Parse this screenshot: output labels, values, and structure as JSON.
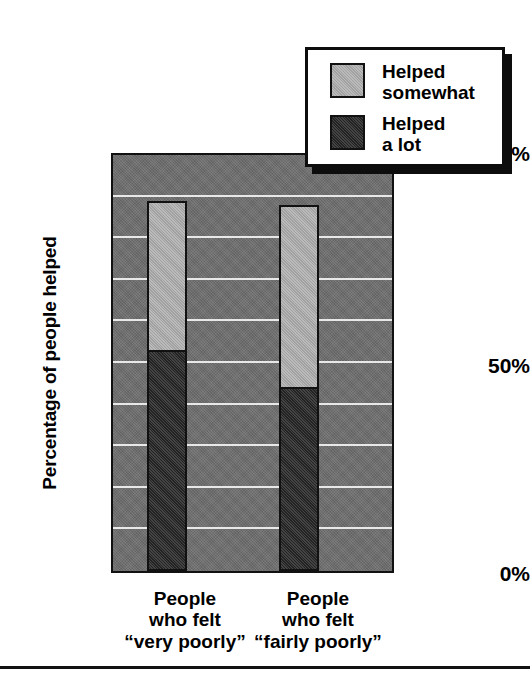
{
  "chart_data": {
    "type": "bar",
    "stacked": true,
    "title": "",
    "xlabel": "",
    "ylabel": "Percentage of people helped",
    "ylim": [
      0,
      100
    ],
    "ytick_labels": [
      "100%",
      "50%",
      "0%"
    ],
    "ytick_values": [
      100,
      50,
      0
    ],
    "gridlines": [
      10,
      20,
      30,
      40,
      50,
      60,
      70,
      80,
      90
    ],
    "grid": true,
    "legend_position": "top-right",
    "categories": [
      "People who felt “very poorly”",
      "People who felt “fairly poorly”"
    ],
    "category_lines": [
      [
        "People",
        "who felt",
        "“very poorly”"
      ],
      [
        "People",
        "who felt",
        "“fairly poorly”"
      ]
    ],
    "category_emphasis": [
      "very",
      "fairly"
    ],
    "series": [
      {
        "name": "Helped a lot",
        "values": [
          53,
          44
        ],
        "color": "#282828"
      },
      {
        "name": "Helped somewhat",
        "values": [
          36,
          44
        ],
        "color": "#b3b3b3"
      }
    ],
    "stack_totals": [
      89,
      88
    ],
    "plot_background": "#6e6e6e",
    "gridline_color": "#e8e8e8",
    "outline_color": "#111111"
  },
  "axes": {
    "y_title": "Percentage of people helped",
    "ticks": [
      {
        "label": "100%",
        "value": 100
      },
      {
        "label": "50%",
        "value": 50
      },
      {
        "label": "0%",
        "value": 0
      }
    ]
  },
  "legend": {
    "entries": [
      {
        "line1": "Helped",
        "line2": "somewhat",
        "swatch": "light-gray"
      },
      {
        "line1": "Helped",
        "line2": "a lot",
        "swatch": "dark-gray"
      }
    ]
  },
  "categories": [
    {
      "line1": "People",
      "line2": "who felt",
      "quote_open": "“",
      "emphasis": "very",
      "rest": " poorly”"
    },
    {
      "line1": "People",
      "line2": "who felt",
      "quote_open": "“",
      "emphasis": "fairly",
      "rest": " poorly”"
    }
  ]
}
